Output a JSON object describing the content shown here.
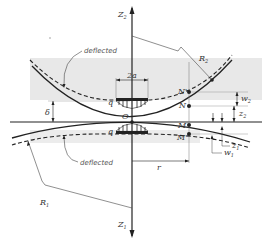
{
  "figure": {
    "colors": {
      "background": "#ffffff",
      "shade": "#e6e6e6",
      "line": "#222222",
      "thin_line": "#777777"
    },
    "axes": {
      "z2": {
        "base": "Z",
        "sub": "2"
      },
      "z1": {
        "base": "Z",
        "sub": "1"
      }
    },
    "labels": {
      "deflected_upper": "deflected",
      "deflected_lower": "deflected",
      "contact_width": "2a",
      "pressure_upper": "q",
      "pressure_lower": "q",
      "origin": "O",
      "delta": "δ",
      "radius_upper": {
        "base": "R",
        "sub": "2"
      },
      "radius_lower": {
        "base": "R",
        "sub": "1"
      },
      "point_N_prime": "N'",
      "point_N": "N",
      "point_M": "M",
      "point_M_prime": "M'",
      "w2": {
        "base": "w",
        "sub": "2"
      },
      "z2": {
        "base": "z",
        "sub": "2"
      },
      "z1": {
        "base": "z",
        "sub": "1"
      },
      "w1": {
        "base": "w",
        "sub": "1"
      },
      "r": "r"
    }
  }
}
